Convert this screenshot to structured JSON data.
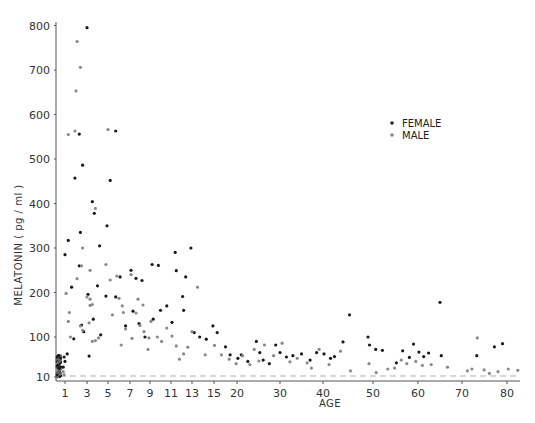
{
  "chart_data": {
    "type": "scatter",
    "title": "",
    "xlabel": "AGE",
    "ylabel": "MELATONIN ( pg / ml )",
    "x_ticks": [
      1,
      3,
      5,
      7,
      9,
      11,
      13,
      15,
      20,
      30,
      40,
      50,
      60,
      70,
      80
    ],
    "y_ticks": [
      10,
      100,
      200,
      300,
      400,
      500,
      600,
      700,
      800
    ],
    "xlim": [
      0,
      83
    ],
    "ylim": [
      0,
      800
    ],
    "grid": false,
    "legend_position": "upper right",
    "reference_line": {
      "style": "dashed",
      "value": 12
    },
    "series": [
      {
        "name": "FEMALE",
        "marker": "filled-dot",
        "points": [
          [
            3.0,
            795
          ],
          [
            2.3,
            556
          ],
          [
            5.7,
            563
          ],
          [
            2.6,
            486
          ],
          [
            1.9,
            457
          ],
          [
            5.2,
            452
          ],
          [
            3.5,
            404
          ],
          [
            2.4,
            335
          ],
          [
            1.3,
            317
          ],
          [
            4.2,
            305
          ],
          [
            1.0,
            285
          ],
          [
            3.7,
            378
          ],
          [
            4.9,
            350
          ],
          [
            1.6,
            212
          ],
          [
            2.3,
            260
          ],
          [
            4.0,
            215
          ],
          [
            4.8,
            192
          ],
          [
            5.7,
            190
          ],
          [
            3.1,
            196
          ],
          [
            3.6,
            140
          ],
          [
            2.5,
            127
          ],
          [
            2.7,
            112
          ],
          [
            1.8,
            96
          ],
          [
            3.2,
            57
          ],
          [
            4.3,
            105
          ],
          [
            6.1,
            235
          ],
          [
            7.1,
            250
          ],
          [
            7.6,
            232
          ],
          [
            8.2,
            227
          ],
          [
            7.3,
            158
          ],
          [
            6.6,
            125
          ],
          [
            7.9,
            130
          ],
          [
            8.5,
            100
          ],
          [
            9.2,
            263
          ],
          [
            9.8,
            261
          ],
          [
            10.0,
            160
          ],
          [
            9.3,
            140
          ],
          [
            10.6,
            170
          ],
          [
            11.4,
            290
          ],
          [
            11.5,
            249
          ],
          [
            12.1,
            191
          ],
          [
            11.1,
            133
          ],
          [
            12.4,
            235
          ],
          [
            12.2,
            160
          ],
          [
            12.9,
            300
          ],
          [
            13.2,
            110
          ],
          [
            13.7,
            100
          ],
          [
            14.3,
            95
          ],
          [
            14.9,
            125
          ],
          [
            15.7,
            110
          ],
          [
            17.5,
            78
          ],
          [
            18.5,
            60
          ],
          [
            20.2,
            52
          ],
          [
            21.0,
            60
          ],
          [
            22.5,
            45
          ],
          [
            24.5,
            90
          ],
          [
            25.3,
            65
          ],
          [
            26.1,
            48
          ],
          [
            27.5,
            40
          ],
          [
            29.0,
            82
          ],
          [
            30.0,
            65
          ],
          [
            31.5,
            55
          ],
          [
            33.0,
            58
          ],
          [
            35.0,
            62
          ],
          [
            37.0,
            48
          ],
          [
            38.5,
            65
          ],
          [
            40.2,
            62
          ],
          [
            41.5,
            52
          ],
          [
            42.3,
            56
          ],
          [
            44.0,
            89
          ],
          [
            45.3,
            150
          ],
          [
            49.0,
            100
          ],
          [
            49.3,
            82
          ],
          [
            50.6,
            72
          ],
          [
            52.1,
            70
          ],
          [
            55.2,
            42
          ],
          [
            56.6,
            69
          ],
          [
            58.1,
            54
          ],
          [
            59.0,
            84
          ],
          [
            60.2,
            66
          ],
          [
            61.3,
            56
          ],
          [
            62.4,
            64
          ],
          [
            65.0,
            178
          ],
          [
            65.3,
            58
          ],
          [
            73.3,
            58
          ],
          [
            77.2,
            78
          ],
          [
            79.0,
            85
          ],
          [
            1.0,
            45
          ],
          [
            0.9,
            55
          ],
          [
            1.2,
            62
          ],
          [
            0.8,
            32
          ]
        ]
      },
      {
        "name": "MALE",
        "marker": "open-dot",
        "points": [
          [
            2.1,
            764
          ],
          [
            2.4,
            706
          ],
          [
            2.0,
            653
          ],
          [
            1.9,
            563
          ],
          [
            5.0,
            566
          ],
          [
            1.3,
            555
          ],
          [
            3.8,
            389
          ],
          [
            2.6,
            300
          ],
          [
            2.5,
            260
          ],
          [
            3.3,
            250
          ],
          [
            3.3,
            171
          ],
          [
            2.1,
            231
          ],
          [
            1.1,
            198
          ],
          [
            1.4,
            155
          ],
          [
            1.3,
            135
          ],
          [
            1.5,
            100
          ],
          [
            3.3,
            185
          ],
          [
            3.0,
            190
          ],
          [
            3.5,
            173
          ],
          [
            2.4,
            125
          ],
          [
            2.6,
            115
          ],
          [
            3.2,
            132
          ],
          [
            3.5,
            90
          ],
          [
            3.8,
            92
          ],
          [
            4.1,
            98
          ],
          [
            4.8,
            263
          ],
          [
            5.2,
            228
          ],
          [
            5.4,
            150
          ],
          [
            5.8,
            237
          ],
          [
            6.0,
            187
          ],
          [
            6.3,
            170
          ],
          [
            6.4,
            155
          ],
          [
            6.2,
            82
          ],
          [
            6.6,
            118
          ],
          [
            7.1,
            240
          ],
          [
            7.2,
            97
          ],
          [
            7.6,
            154
          ],
          [
            7.8,
            185
          ],
          [
            8.0,
            126
          ],
          [
            8.3,
            172
          ],
          [
            8.4,
            112
          ],
          [
            8.8,
            72
          ],
          [
            8.9,
            98
          ],
          [
            9.1,
            135
          ],
          [
            9.7,
            100
          ],
          [
            10.1,
            90
          ],
          [
            10.6,
            120
          ],
          [
            11.1,
            102
          ],
          [
            11.5,
            80
          ],
          [
            11.8,
            50
          ],
          [
            12.2,
            62
          ],
          [
            12.6,
            77
          ],
          [
            13.0,
            112
          ],
          [
            13.5,
            212
          ],
          [
            14.2,
            60
          ],
          [
            15.1,
            81
          ],
          [
            16.6,
            60
          ],
          [
            18.3,
            50
          ],
          [
            19.8,
            40
          ],
          [
            21.3,
            58
          ],
          [
            23.0,
            38
          ],
          [
            24.0,
            72
          ],
          [
            25.1,
            46
          ],
          [
            26.4,
            82
          ],
          [
            28.5,
            58
          ],
          [
            30.5,
            86
          ],
          [
            32.3,
            44
          ],
          [
            34.0,
            52
          ],
          [
            36.3,
            42
          ],
          [
            37.3,
            30
          ],
          [
            39.1,
            72
          ],
          [
            41.2,
            38
          ],
          [
            43.5,
            68
          ],
          [
            45.5,
            24
          ],
          [
            49.2,
            40
          ],
          [
            50.7,
            20
          ],
          [
            53.3,
            28
          ],
          [
            54.8,
            30
          ],
          [
            56.3,
            48
          ],
          [
            57.5,
            40
          ],
          [
            59.5,
            45
          ],
          [
            61.0,
            36
          ],
          [
            63.0,
            38
          ],
          [
            66.7,
            32
          ],
          [
            71.2,
            24
          ],
          [
            72.2,
            28
          ],
          [
            73.4,
            98
          ],
          [
            74.9,
            26
          ],
          [
            76.1,
            18
          ],
          [
            78.0,
            22
          ],
          [
            80.3,
            28
          ],
          [
            82.5,
            25
          ],
          [
            0.8,
            22
          ],
          [
            0.9,
            15
          ]
        ]
      }
    ]
  },
  "legend": {
    "items": [
      {
        "label": "FEMALE",
        "marker": "filled-dot"
      },
      {
        "label": "MALE",
        "marker": "open-dot"
      }
    ]
  },
  "axes": {
    "x_title": "AGE",
    "y_title": "MELATONIN ( pg / ml )"
  }
}
